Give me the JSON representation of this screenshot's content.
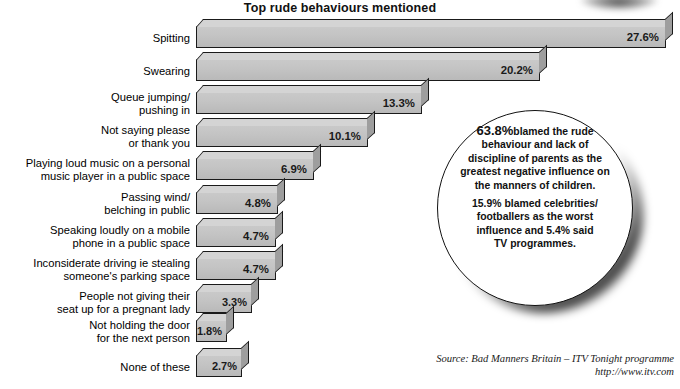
{
  "title": "Top rude behaviours mentioned",
  "chart_data": {
    "type": "bar",
    "orientation": "horizontal",
    "title": "Top rude behaviours mentioned",
    "xlabel": "",
    "ylabel": "",
    "xlim": [
      0,
      28
    ],
    "grid": false,
    "legend": "none",
    "value_suffix": "%",
    "categories": [
      "Spitting",
      "Swearing",
      "Queue jumping/\npushing in",
      "Not saying please\nor thank you",
      "Playing loud music on a personal\nmusic player in a public space",
      "Passing wind/\nbelching in public",
      "Speaking loudly on a mobile\nphone in a public space",
      "Inconsiderate driving ie stealing\nsomeone's parking space",
      "People not giving their\nseat up for a pregnant lady",
      "Not holding the door\nfor the next person",
      "None of these"
    ],
    "values": [
      27.6,
      20.2,
      13.3,
      10.1,
      6.9,
      4.8,
      4.7,
      4.7,
      3.3,
      1.8,
      2.7
    ],
    "value_labels": [
      "27.6%",
      "20.2%",
      "13.3%",
      "10.1%",
      "6.9%",
      "4.8%",
      "4.7%",
      "4.7%",
      "3.3%",
      "1.8%",
      "2.7%"
    ]
  },
  "callout": {
    "paragraph1": "63.8%",
    "paragraph1_rest": "blamed the rude\nbehaviour and lack of\ndiscipline of parents as the\ngreatest negative influence on\nthe manners of children.",
    "paragraph2": "15.9% blamed celebrities/\nfootballers as the worst\ninfluence and 5.4% said\nTV programmes."
  },
  "source": {
    "line1": "Source: Bad Manners Britain – ITV Tonight programme",
    "line2": "http://www.itv.com"
  },
  "colors": {
    "bar_front": "#c4c4c4",
    "bar_top": "#d4d4d4",
    "bar_side": "#9e9e9e",
    "outline": "#1a1a1a",
    "background": "#ffffff"
  }
}
